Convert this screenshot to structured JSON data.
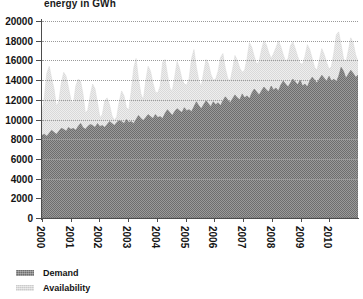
{
  "chart": {
    "title": "energy in GWh",
    "legend": {
      "position": "bottom-left",
      "items": [
        {
          "label": "Demand",
          "color": "#6e6e6e",
          "swatch": "demand-swatch"
        },
        {
          "label": "Availability",
          "color": "#d9d9d9",
          "swatch": "availability-swatch"
        }
      ]
    }
  },
  "chart_data": {
    "type": "area",
    "title": "energy in GWh",
    "xlabel": "",
    "ylabel": "energy in GWh",
    "ylim": [
      0,
      20000
    ],
    "ytick_step": 2000,
    "yticks": [
      0,
      2000,
      4000,
      6000,
      8000,
      10000,
      12000,
      14000,
      16000,
      18000,
      20000
    ],
    "ytick_labels": [
      "0",
      "2000",
      "4000",
      "6000",
      "8000",
      "10000",
      "12000",
      "14000",
      "16000",
      "18000",
      "20000"
    ],
    "xticks": [
      2000,
      2001,
      2002,
      2003,
      2004,
      2005,
      2006,
      2007,
      2008,
      2009,
      2010
    ],
    "xtick_labels": [
      "2000",
      "2001",
      "2002",
      "2003",
      "2004",
      "2005",
      "2006",
      "2007",
      "2008",
      "2009",
      "2010"
    ],
    "xtick_rotation": 90,
    "xlim": [
      2000,
      2011
    ],
    "grid": true,
    "grid_style": "dotted-horizontal",
    "stacked": false,
    "x_unit": "month",
    "series": [
      {
        "name": "Availability",
        "color": "#d9d9d9",
        "values": [
          10800,
          12300,
          14700,
          15400,
          14200,
          13100,
          11300,
          11900,
          13700,
          14800,
          14400,
          13200,
          12000,
          11600,
          13400,
          14100,
          13900,
          12600,
          10600,
          11000,
          12500,
          13600,
          13100,
          11700,
          10200,
          10500,
          11900,
          12200,
          11500,
          10400,
          9900,
          10300,
          11800,
          12900,
          12400,
          11200,
          11000,
          12900,
          15200,
          16200,
          14100,
          12600,
          12000,
          13900,
          15400,
          14900,
          13700,
          12800,
          12700,
          13400,
          15800,
          16100,
          14600,
          13200,
          12900,
          14300,
          15900,
          15200,
          14100,
          13600,
          13500,
          14200,
          16200,
          17100,
          15300,
          14000,
          13300,
          14800,
          16100,
          15700,
          14600,
          14000,
          14100,
          14900,
          16300,
          16700,
          15200,
          14200,
          13900,
          15100,
          16500,
          16000,
          15200,
          14800,
          15000,
          16200,
          17800,
          17300,
          16400,
          15600,
          15900,
          17100,
          18000,
          17600,
          16800,
          16200,
          16700,
          17300,
          18000,
          17400,
          16600,
          15900,
          16200,
          17500,
          17900,
          17200,
          16400,
          15700,
          15600,
          16400,
          17600,
          17100,
          16200,
          15300,
          15000,
          16100,
          17200,
          16600,
          15800,
          15100,
          15400,
          16800,
          18600,
          18900,
          17600,
          16200,
          15800,
          17000,
          18300,
          17800,
          16600,
          15900
        ]
      },
      {
        "name": "Demand",
        "color": "#6e6e6e",
        "values": [
          8400,
          8500,
          8300,
          8600,
          8900,
          8700,
          8500,
          8800,
          9100,
          9000,
          8800,
          9200,
          9000,
          9100,
          8900,
          9300,
          9600,
          9200,
          9000,
          9300,
          9500,
          9400,
          9200,
          9600,
          9300,
          9400,
          9200,
          9500,
          9800,
          9600,
          9400,
          9700,
          9900,
          9800,
          9600,
          10000,
          9700,
          9800,
          9600,
          10000,
          10400,
          10100,
          9900,
          10200,
          10500,
          10300,
          10100,
          10500,
          10200,
          10300,
          10100,
          10600,
          11000,
          10700,
          10400,
          10800,
          11100,
          10900,
          10700,
          11200,
          10900,
          11000,
          10800,
          11300,
          11800,
          11400,
          11100,
          11500,
          11900,
          11600,
          11300,
          11800,
          11500,
          11700,
          11400,
          11900,
          12300,
          12000,
          11700,
          12100,
          12500,
          12200,
          12000,
          12600,
          12200,
          12400,
          12100,
          12700,
          13100,
          12800,
          12500,
          12900,
          13300,
          13000,
          12800,
          13400,
          13000,
          13200,
          12900,
          13500,
          13900,
          13600,
          13300,
          13700,
          14100,
          13800,
          13500,
          14000,
          13400,
          13600,
          13300,
          13900,
          14300,
          14000,
          13700,
          14100,
          14500,
          14200,
          13900,
          14400,
          13900,
          14100,
          13800,
          14400,
          15300,
          14900,
          14200,
          14600,
          15000,
          14700,
          14300,
          14500
        ]
      }
    ]
  }
}
